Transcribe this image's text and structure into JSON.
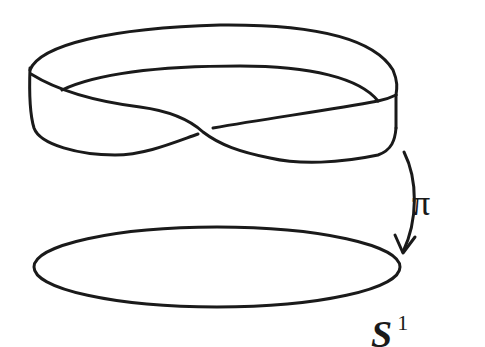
{
  "diagram": {
    "nodes": [
      {
        "id": "mobius",
        "label": "",
        "shape": "möbius-strip"
      },
      {
        "id": "circle",
        "label": "S1",
        "shape": "ellipse"
      }
    ],
    "edges": [
      {
        "from": "mobius",
        "to": "circle",
        "label": "π",
        "style": "curved-arrow"
      }
    ],
    "labels": {
      "projection": "π",
      "base_symbol": "S",
      "base_superscript": "1"
    },
    "colors": {
      "ink": "#1a1a1a",
      "background": "#ffffff"
    }
  }
}
